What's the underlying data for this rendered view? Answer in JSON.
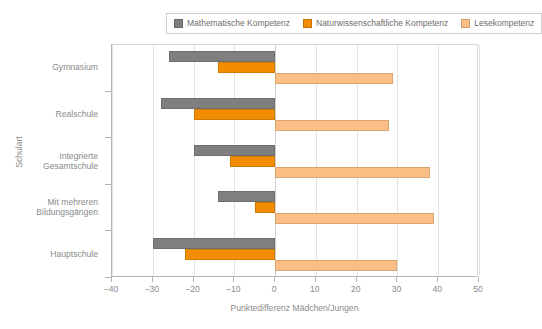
{
  "legend": {
    "position": "top",
    "items": [
      {
        "label": "Mathematische Kompetenz",
        "color": "#7f7f7f",
        "icon": "legend-swatch-icon"
      },
      {
        "label": "Naturwissenschaftliche Kompetenz",
        "color": "#f28c00",
        "icon": "legend-swatch-icon"
      },
      {
        "label": "Lesekompetenz",
        "color": "#fbbe85",
        "icon": "legend-swatch-icon"
      }
    ]
  },
  "axes": {
    "y_title": "Schulart",
    "x_title": "Punktedifferenz Mädchen/Jungen",
    "x_ticks": [
      "−40",
      "−30",
      "−20",
      "−10",
      "0",
      "10",
      "20",
      "30",
      "40",
      "50"
    ]
  },
  "chart_data": {
    "type": "bar",
    "orientation": "horizontal",
    "title": "",
    "xlabel": "Punktedifferenz Mädchen/Jungen",
    "ylabel": "Schulart",
    "xlim": [
      -40,
      50
    ],
    "xticks": [
      -40,
      -30,
      -20,
      -10,
      0,
      10,
      20,
      30,
      40,
      50
    ],
    "grid": true,
    "legend_position": "top",
    "categories": [
      "Gymnasium",
      "Realschule",
      "Integrierte Gesamtschule",
      "Mit mehreren Bildungsgängen",
      "Hauptschule"
    ],
    "category_labels": [
      [
        "Gymnasium"
      ],
      [
        "Realschule"
      ],
      [
        "Integrierte",
        "Gesamtschule"
      ],
      [
        "Mit mehreren",
        "Bildungsgängen"
      ],
      [
        "Hauptschule"
      ]
    ],
    "series": [
      {
        "name": "Mathematische Kompetenz",
        "color": "#7f7f7f",
        "values": [
          -26,
          -28,
          -20,
          -14,
          -30
        ]
      },
      {
        "name": "Naturwissenschaftliche Kompetenz",
        "color": "#f28c00",
        "values": [
          -14,
          -20,
          -11,
          -5,
          -22
        ]
      },
      {
        "name": "Lesekompetenz",
        "color": "#fbbe85",
        "values": [
          29,
          28,
          38,
          39,
          30
        ]
      }
    ]
  }
}
